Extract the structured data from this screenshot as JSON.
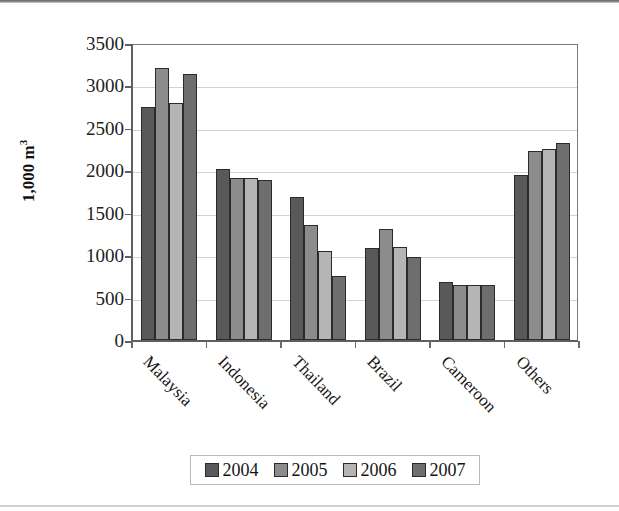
{
  "chart_data": {
    "type": "bar",
    "title": "",
    "subtitle": "",
    "xlabel": "",
    "ylabel": "1,000 m",
    "ylabel_superscript": "3",
    "categories": [
      "Malaysia",
      "Indonesia",
      "Thailand",
      "Brazil",
      "Cameroon",
      "Others"
    ],
    "series": [
      {
        "name": "2004",
        "color": "#595959",
        "values": [
          2750,
          2010,
          1690,
          1090,
          680,
          1940
        ]
      },
      {
        "name": "2005",
        "color": "#8c8c8c",
        "values": [
          3200,
          1910,
          1350,
          1310,
          650,
          2230
        ]
      },
      {
        "name": "2006",
        "color": "#b5b5b5",
        "values": [
          2790,
          1910,
          1050,
          1100,
          650,
          2250
        ]
      },
      {
        "name": "2007",
        "color": "#6e6e6e",
        "values": [
          3130,
          1880,
          750,
          980,
          650,
          2320
        ]
      }
    ],
    "ylim": [
      0,
      3500
    ],
    "ytick_step": 500,
    "yticks": [
      0,
      500,
      1000,
      1500,
      2000,
      2500,
      3000,
      3500
    ],
    "ytick_labels": [
      "0",
      "500",
      "1000",
      "1500",
      "2000",
      "2500",
      "3000",
      "3500"
    ],
    "grid": true,
    "grid_axis": "y",
    "legend_position": "bottom",
    "legend_entries": [
      "2004",
      "2005",
      "2006",
      "2007"
    ],
    "xtick_label_rotation": 46
  },
  "colors": {
    "plot_border": "#7a7a7a",
    "gridline": "#d2d2d2",
    "axis": "#5f5f5f",
    "bar_outline": "#2b2b2b",
    "legend_border": "#b9b9b9",
    "background": "#ffffff"
  },
  "scan": {
    "ghost_text": " "
  }
}
